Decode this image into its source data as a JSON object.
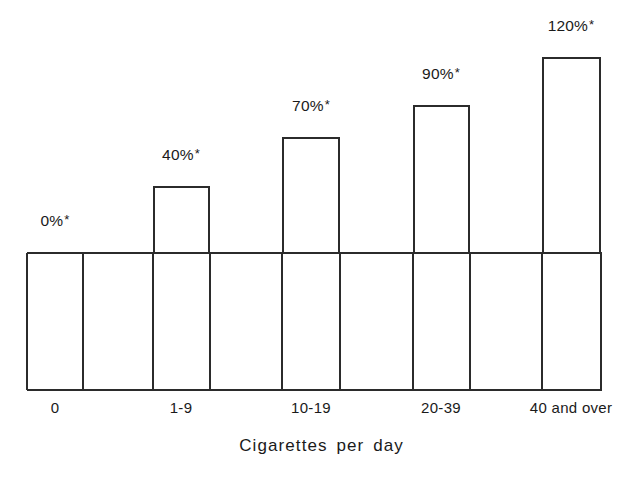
{
  "chart_data": {
    "type": "bar",
    "title": "",
    "subtitle": "",
    "xlabel": "Cigarettes per day",
    "ylabel": "",
    "categories": [
      "0",
      "1-9",
      "10-19",
      "20-39",
      "40 and over"
    ],
    "values": [
      0,
      40,
      70,
      90,
      120
    ],
    "value_labels": [
      "0%",
      "40%",
      "70%",
      "90%",
      "120%"
    ],
    "value_label_suffix": "*",
    "value_labels_full": [
      "0%*",
      "40%*",
      "70%*",
      "90%*",
      "120%*"
    ],
    "ylim": [
      0,
      130
    ],
    "grid": false,
    "legend": null,
    "legend_position": "none",
    "annotations": [
      "*"
    ],
    "series": [
      {
        "name": "Excess mortality",
        "values": [
          0,
          40,
          70,
          90,
          120
        ]
      }
    ],
    "bar_geometry": [
      {
        "category": "0",
        "left": 27,
        "right": 83,
        "top": 253,
        "label_x": 55,
        "label_y": 212
      },
      {
        "category": "1-9",
        "left": 153,
        "right": 210,
        "top": 186,
        "label_x": 181,
        "label_y": 146
      },
      {
        "category": "10-19",
        "left": 282,
        "right": 340,
        "top": 137,
        "label_x": 311,
        "label_y": 97
      },
      {
        "category": "20-39",
        "left": 413,
        "right": 470,
        "top": 105,
        "label_x": 441,
        "label_y": 65
      },
      {
        "category": "40 and over",
        "left": 542,
        "right": 601,
        "top": 57,
        "label_x": 571,
        "label_y": 17
      }
    ],
    "grid_vlines": [
      27,
      83,
      153,
      210,
      282,
      340,
      413,
      470,
      542,
      601
    ],
    "cat_label_x": [
      55,
      181,
      311,
      441,
      571
    ],
    "baseline_y": 252,
    "bottom_axis_y": 389,
    "colors": {
      "ink": "#2b2b2b",
      "text": "#1a1a1a",
      "background": "#ffffff",
      "bar_fill": "transparent"
    }
  }
}
